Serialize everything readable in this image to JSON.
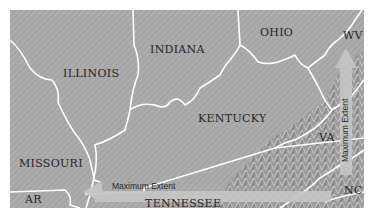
{
  "map": {
    "title": "",
    "background_color": "#a9a9a9",
    "border_color": "#ffffff",
    "arrow_color": "#c6c6c6",
    "labels": {
      "illinois": "ILLINOIS",
      "indiana": "INDIANA",
      "ohio": "OHIO",
      "wv": "WV",
      "kentucky": "KENTUCKY",
      "va": "VA",
      "missouri": "MISSOURI",
      "ar": "AR",
      "tennessee": "TENNESSEE",
      "nc": "NC"
    },
    "arrows": {
      "horizontal": {
        "label": "Maximum Extent",
        "direction": "west"
      },
      "vertical": {
        "label": "Maximum Extent",
        "direction": "north"
      }
    }
  }
}
